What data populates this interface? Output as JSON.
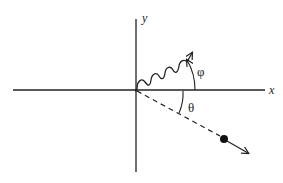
{
  "diagram": {
    "type": "physics-scattering-diagram",
    "axes": {
      "x_label": "x",
      "y_label": "y"
    },
    "photon": {
      "description": "wavy line (emitted photon) from origin, arrow up-right",
      "angle_label": "φ"
    },
    "particle": {
      "description": "dashed path from origin to solid particle dot, arrow down-right",
      "angle_label": "θ"
    },
    "colors": {
      "ink": "#222222",
      "background": "#ffffff"
    }
  }
}
